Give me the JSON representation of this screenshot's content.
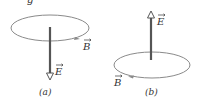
{
  "figure": {
    "top_fragment": "g",
    "panels": [
      {
        "id": "a",
        "caption": "(a)",
        "field_E_label": "E",
        "field_B_label": "B",
        "E_direction": "down",
        "B_circulation": "counterclockwise-viewed-from-above"
      },
      {
        "id": "b",
        "caption": "(b)",
        "field_E_label": "E",
        "field_B_label": "B",
        "E_direction": "up",
        "B_circulation": "clockwise-viewed-from-above"
      }
    ],
    "colors": {
      "loop": "#8a8a8a",
      "rod": "#555555",
      "text": "#333333"
    }
  }
}
